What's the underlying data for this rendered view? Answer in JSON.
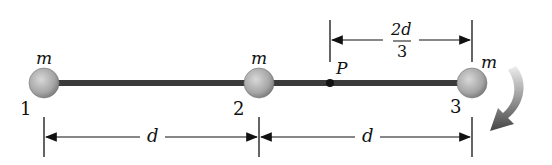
{
  "diagram": {
    "masses": [
      {
        "id": "1",
        "label": "m",
        "number": "1"
      },
      {
        "id": "2",
        "label": "m",
        "number": "2"
      },
      {
        "id": "3",
        "label": "m",
        "number": "3"
      }
    ],
    "point": {
      "label": "P"
    },
    "dimensions": {
      "d12": "d",
      "d23": "d",
      "top_numerator": "2d",
      "top_denominator": "3"
    },
    "rotation_arrow": "clockwise-rotation-arrow",
    "colors": {
      "rod": "#3a3a3a",
      "ball": "#a8a8a8",
      "arrow": "#555555"
    }
  }
}
